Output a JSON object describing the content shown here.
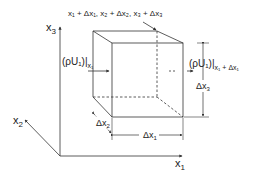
{
  "diagram": {
    "axes": {
      "x1": {
        "label": "x",
        "subscript": "1"
      },
      "x2": {
        "label": "x",
        "subscript": "2"
      },
      "x3": {
        "label": "x",
        "subscript": "3"
      }
    },
    "corner_label": "x₁ + Δx₁, x₂ + Δx₂, x₃ + Δx₃",
    "flux_in": {
      "main": "(ρU₁)|",
      "sub": "x₁"
    },
    "flux_out": {
      "main": "(ρU₁)|",
      "sub": "x₁ + Δx₁"
    },
    "dimensions": {
      "dx1": {
        "label": "Δx",
        "subscript": "1"
      },
      "dx2": {
        "label": "Δx",
        "subscript": "2"
      },
      "dx3": {
        "label": "Δx",
        "subscript": "3"
      }
    },
    "colors": {
      "line": "#333333",
      "text": "#222222"
    }
  }
}
